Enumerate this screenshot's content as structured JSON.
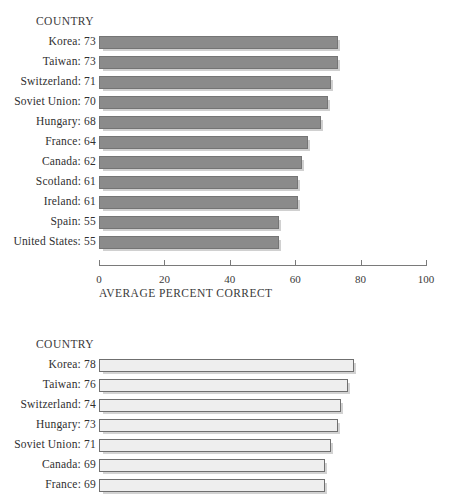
{
  "figure": {
    "background_color": "#ffffff",
    "text_color": "#2f2f2f"
  },
  "chart_data": [
    {
      "id": "chart-top",
      "type": "bar",
      "orientation": "horizontal",
      "title": "",
      "category_axis_title": "COUNTRY",
      "xlabel": "AVERAGE PERCENT CORRECT",
      "ylabel": "",
      "xlim": [
        0,
        100
      ],
      "xticks": [
        0,
        20,
        40,
        60,
        80,
        100
      ],
      "xtick_labels": [
        "0",
        "20",
        "40",
        "60",
        "80",
        "100"
      ],
      "grid": false,
      "legend": false,
      "bar_style": "filled-gray",
      "bar_color": "#8b8b8b",
      "bar_edge_color": "#757575",
      "categories": [
        "Korea",
        "Taiwan",
        "Switzerland",
        "Soviet Union",
        "Hungary",
        "France",
        "Canada",
        "Scotland",
        "Ireland",
        "Spain",
        "United States"
      ],
      "values": [
        73,
        73,
        71,
        70,
        68,
        64,
        62,
        61,
        61,
        55,
        55
      ],
      "row_labels": [
        "Korea: 73",
        "Taiwan: 73",
        "Switzerland: 71",
        "Soviet Union: 70",
        "Hungary: 68",
        "France: 64",
        "Canada: 62",
        "Scotland: 61",
        "Ireland: 61",
        "Spain: 55",
        "United States: 55"
      ]
    },
    {
      "id": "chart-bottom",
      "type": "bar",
      "orientation": "horizontal",
      "title": "",
      "category_axis_title": "COUNTRY",
      "xlabel": "",
      "ylabel": "",
      "xlim": [
        0,
        100
      ],
      "xticks": [],
      "xtick_labels": [],
      "grid": false,
      "legend": false,
      "bar_style": "hollow-outline",
      "bar_color": "#eeeeee",
      "bar_edge_color": "#6f6f6f",
      "note": "chart is cropped at the bottom edge of the screenshot; last visible row is France",
      "categories": [
        "Korea",
        "Taiwan",
        "Switzerland",
        "Hungary",
        "Soviet Union",
        "Canada",
        "France"
      ],
      "values": [
        78,
        76,
        74,
        73,
        71,
        69,
        69
      ],
      "row_labels": [
        "Korea: 78",
        "Taiwan: 76",
        "Switzerland: 74",
        "Hungary: 73",
        "Soviet Union: 71",
        "Canada: 69",
        "France: 69"
      ]
    }
  ]
}
